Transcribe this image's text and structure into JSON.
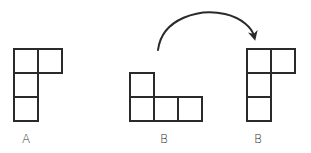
{
  "diagram": {
    "colors": {
      "stroke": "#2a2a2a",
      "background": "#ffffff",
      "label": "#333333"
    },
    "cell_size": 24,
    "shapes": [
      {
        "id": "A",
        "label": "A",
        "origin": [
          14,
          49
        ],
        "cells": [
          [
            0,
            0
          ],
          [
            1,
            0
          ],
          [
            0,
            1
          ],
          [
            0,
            2
          ]
        ]
      },
      {
        "id": "B-original",
        "label": "B",
        "origin": [
          130,
          49
        ],
        "cells": [
          [
            0,
            1
          ],
          [
            0,
            2
          ],
          [
            1,
            2
          ],
          [
            2,
            2
          ]
        ]
      },
      {
        "id": "B-rotated",
        "label": "B",
        "origin": [
          247,
          49
        ],
        "cells": [
          [
            0,
            0
          ],
          [
            1,
            0
          ],
          [
            0,
            1
          ],
          [
            0,
            2
          ]
        ]
      }
    ],
    "arrow": {
      "from": "B-original",
      "to": "B-rotated",
      "meaning": "rotation"
    }
  }
}
